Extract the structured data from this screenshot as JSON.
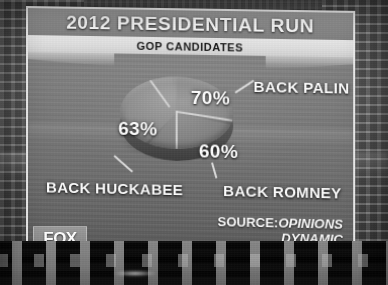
{
  "broadcast": {
    "title": "2012 PRESIDENTIAL RUN",
    "subtitle": "GOP CANDIDATES",
    "source_prefix": "SOURCE:",
    "source_name_line1": "OPINIONS",
    "source_name_line2": "DYNAMIC",
    "network_logo": "FOX",
    "temperature": "47°"
  },
  "chart_data": {
    "type": "pie",
    "title": "2012 PRESIDENTIAL RUN",
    "subtitle": "GOP CANDIDATES",
    "categories": [
      "BACK PALIN",
      "BACK HUCKABEE",
      "BACK ROMNEY"
    ],
    "values": [
      70,
      63,
      60
    ],
    "value_labels": [
      "70%",
      "63%",
      "60%"
    ],
    "unit": "%",
    "total": 193,
    "legend": "none",
    "grid": false,
    "annotations": [
      "Values sum to 193%, exceeding 100%"
    ],
    "source": "SOURCE: OPINIONS DYNAMIC",
    "slices": [
      {
        "label": "BACK PALIN",
        "value": 70,
        "display": "70%"
      },
      {
        "label": "BACK HUCKABEE",
        "value": 63,
        "display": "63%"
      },
      {
        "label": "BACK ROMNEY",
        "value": 60,
        "display": "60%"
      }
    ]
  },
  "colors": {
    "panel_frame": "#efefef",
    "title_band": "#8e8e8e",
    "subtitle_band": "#dcdcdc",
    "label_text": "#fcfcfc",
    "desk": "#121212"
  }
}
